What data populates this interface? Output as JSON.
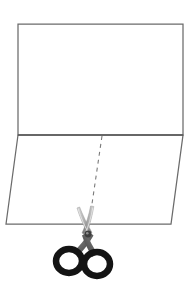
{
  "figure": {
    "title": "Paper fold and cut diagram",
    "background_color": "#ffffff",
    "width": 192,
    "height": 299,
    "caption": ""
  },
  "colors": {
    "outline": "#6b6b6b",
    "outline_dark": "#5a5a5a",
    "dashed_line": "#7a7a7a",
    "scissor_blade_light": "#cfcfcf",
    "scissor_blade_mid": "#9a9a9a",
    "scissor_blade_dark": "#6e6e6e",
    "scissor_handle": "#141414",
    "paper_fill": "#ffffff"
  },
  "shapes": {
    "upper_sheet": {
      "name": "upper-rectangle",
      "label": "",
      "points": "18,24 183,24 183,135 18,135"
    },
    "lower_flap": {
      "name": "lower-parallelogram",
      "label": "",
      "points": "18,135 183,135 171,224 6,224"
    },
    "fold_line": {
      "name": "fold-edge",
      "label": "",
      "x1": 18,
      "y1": 135,
      "x2": 183,
      "y2": 135
    }
  },
  "cut_line": {
    "name": "dashed-cut-line",
    "label": "",
    "x1": 102,
    "y1": 136,
    "x2": 88,
    "y2": 231,
    "dash_pattern": "4 4",
    "stroke_width": 1.1
  },
  "scissors": {
    "name": "scissors",
    "label": "",
    "pivot": {
      "x": 88,
      "y": 234
    },
    "blade_left_tip": {
      "x": 78,
      "y": 209
    },
    "blade_right_tip": {
      "x": 93,
      "y": 207
    },
    "handle_left_ring": {
      "cx": 69,
      "cy": 261,
      "rx": 13,
      "ry": 12
    },
    "handle_right_ring": {
      "cx": 97,
      "cy": 264,
      "rx": 13,
      "ry": 12
    },
    "ring_stroke_width": 6.5
  },
  "annotations": []
}
